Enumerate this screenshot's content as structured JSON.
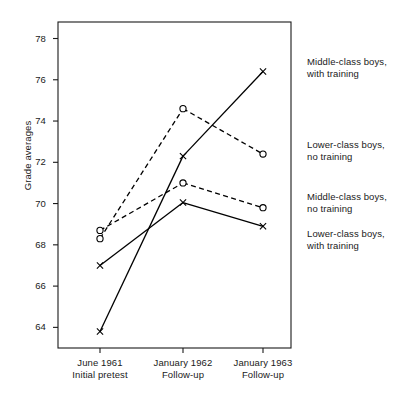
{
  "chart_data": {
    "type": "line",
    "title": "",
    "xlabel": "",
    "ylabel": "Grade averages",
    "categories": [
      "June 1961\nInitial pretest",
      "January 1962\nFollow-up",
      "January 1963\nFollow-up"
    ],
    "x_tick_lines": [
      [
        "June 1961",
        "Initial pretest"
      ],
      [
        "January 1962",
        "Follow-up"
      ],
      [
        "January 1963",
        "Follow-up"
      ]
    ],
    "ylim": [
      63.0,
      78.8
    ],
    "y_ticks": [
      64,
      66,
      68,
      70,
      72,
      74,
      76,
      78
    ],
    "y_tick_labels": [
      "64",
      "66",
      "68",
      "70",
      "72",
      "74",
      "76",
      "78"
    ],
    "grid": false,
    "legend_position": "right-of-axes",
    "series": [
      {
        "name": "Middle-class boys, with training",
        "values": [
          63.8,
          72.3,
          76.4
        ],
        "marker": "x",
        "linestyle": "solid",
        "color": "#000000",
        "label_lines": [
          "Middle-class boys,",
          "with training"
        ],
        "label_y": 56
      },
      {
        "name": "Lower-class boys, no training",
        "values": [
          68.3,
          74.6,
          72.4
        ],
        "marker": "o",
        "linestyle": "dashed",
        "color": "#000000",
        "label_lines": [
          "Lower-class boys,",
          "no training"
        ],
        "label_y": 139
      },
      {
        "name": "Middle-class boys, no training",
        "values": [
          68.7,
          71.0,
          69.8
        ],
        "marker": "o",
        "linestyle": "dashed",
        "color": "#000000",
        "label_lines": [
          "Middle-class boys,",
          "no training"
        ],
        "label_y": 191
      },
      {
        "name": "Lower-class boys, with training",
        "values": [
          67.0,
          70.05,
          68.9
        ],
        "marker": "x",
        "linestyle": "solid",
        "color": "#000000",
        "label_lines": [
          "Lower-class boys,",
          "with training"
        ],
        "label_y": 228
      }
    ]
  }
}
